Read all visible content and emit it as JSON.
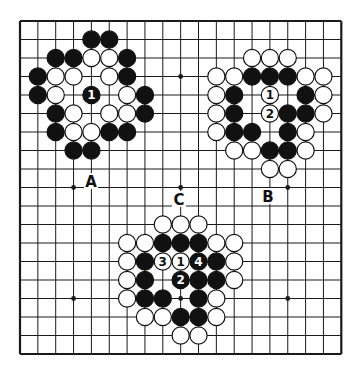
{
  "diagram": {
    "type": "go-board",
    "size": 19,
    "colors": {
      "background": "#ffffff",
      "line": "#1a1a1a",
      "black_stone": "#111111",
      "white_stone": "#ffffff"
    },
    "hoshi": [
      [
        9,
        3
      ],
      [
        3,
        9
      ],
      [
        9,
        9
      ],
      [
        15,
        9
      ],
      [
        3,
        15
      ],
      [
        9,
        15
      ],
      [
        15,
        15
      ]
    ],
    "labels": [
      {
        "text": "A",
        "x": 91,
        "y": 181
      },
      {
        "text": "B",
        "x": 268,
        "y": 196
      },
      {
        "text": "C",
        "x": 179,
        "y": 199
      }
    ],
    "groups": [
      {
        "name": "A",
        "stones": [
          {
            "i": 4,
            "j": 1,
            "c": "B"
          },
          {
            "i": 5,
            "j": 1,
            "c": "B"
          },
          {
            "i": 2,
            "j": 2,
            "c": "B"
          },
          {
            "i": 3,
            "j": 2,
            "c": "B"
          },
          {
            "i": 4,
            "j": 2,
            "c": "W"
          },
          {
            "i": 5,
            "j": 2,
            "c": "W"
          },
          {
            "i": 6,
            "j": 2,
            "c": "B"
          },
          {
            "i": 1,
            "j": 3,
            "c": "B"
          },
          {
            "i": 2,
            "j": 3,
            "c": "W"
          },
          {
            "i": 3,
            "j": 3,
            "c": "W"
          },
          {
            "i": 5,
            "j": 3,
            "c": "W"
          },
          {
            "i": 6,
            "j": 3,
            "c": "B"
          },
          {
            "i": 1,
            "j": 4,
            "c": "B"
          },
          {
            "i": 2,
            "j": 4,
            "c": "W"
          },
          {
            "i": 4,
            "j": 4,
            "c": "B",
            "n": "1"
          },
          {
            "i": 6,
            "j": 4,
            "c": "W"
          },
          {
            "i": 7,
            "j": 4,
            "c": "B"
          },
          {
            "i": 2,
            "j": 5,
            "c": "B"
          },
          {
            "i": 3,
            "j": 5,
            "c": "W"
          },
          {
            "i": 5,
            "j": 5,
            "c": "W"
          },
          {
            "i": 6,
            "j": 5,
            "c": "W"
          },
          {
            "i": 7,
            "j": 5,
            "c": "B"
          },
          {
            "i": 2,
            "j": 6,
            "c": "B"
          },
          {
            "i": 3,
            "j": 6,
            "c": "W"
          },
          {
            "i": 4,
            "j": 6,
            "c": "W"
          },
          {
            "i": 5,
            "j": 6,
            "c": "B"
          },
          {
            "i": 6,
            "j": 6,
            "c": "B"
          },
          {
            "i": 3,
            "j": 7,
            "c": "B"
          },
          {
            "i": 4,
            "j": 7,
            "c": "B"
          }
        ]
      },
      {
        "name": "B",
        "stones": [
          {
            "i": 13,
            "j": 2,
            "c": "W"
          },
          {
            "i": 14,
            "j": 2,
            "c": "W"
          },
          {
            "i": 15,
            "j": 2,
            "c": "W"
          },
          {
            "i": 11,
            "j": 3,
            "c": "W"
          },
          {
            "i": 12,
            "j": 3,
            "c": "W"
          },
          {
            "i": 13,
            "j": 3,
            "c": "B"
          },
          {
            "i": 14,
            "j": 3,
            "c": "B"
          },
          {
            "i": 15,
            "j": 3,
            "c": "B"
          },
          {
            "i": 16,
            "j": 3,
            "c": "W"
          },
          {
            "i": 17,
            "j": 3,
            "c": "W"
          },
          {
            "i": 11,
            "j": 4,
            "c": "W"
          },
          {
            "i": 12,
            "j": 4,
            "c": "B"
          },
          {
            "i": 14,
            "j": 4,
            "c": "W",
            "n": "1"
          },
          {
            "i": 16,
            "j": 4,
            "c": "B"
          },
          {
            "i": 17,
            "j": 4,
            "c": "W"
          },
          {
            "i": 11,
            "j": 5,
            "c": "W"
          },
          {
            "i": 12,
            "j": 5,
            "c": "B"
          },
          {
            "i": 14,
            "j": 5,
            "c": "W",
            "n": "2"
          },
          {
            "i": 15,
            "j": 5,
            "c": "B"
          },
          {
            "i": 16,
            "j": 5,
            "c": "B"
          },
          {
            "i": 17,
            "j": 5,
            "c": "W"
          },
          {
            "i": 11,
            "j": 6,
            "c": "W"
          },
          {
            "i": 12,
            "j": 6,
            "c": "B"
          },
          {
            "i": 13,
            "j": 6,
            "c": "B"
          },
          {
            "i": 15,
            "j": 6,
            "c": "B"
          },
          {
            "i": 16,
            "j": 6,
            "c": "W"
          },
          {
            "i": 12,
            "j": 7,
            "c": "W"
          },
          {
            "i": 13,
            "j": 7,
            "c": "W"
          },
          {
            "i": 14,
            "j": 7,
            "c": "B"
          },
          {
            "i": 15,
            "j": 7,
            "c": "B"
          },
          {
            "i": 16,
            "j": 7,
            "c": "W"
          },
          {
            "i": 14,
            "j": 8,
            "c": "W"
          },
          {
            "i": 15,
            "j": 8,
            "c": "W"
          }
        ]
      },
      {
        "name": "C",
        "stones": [
          {
            "i": 8,
            "j": 11,
            "c": "W"
          },
          {
            "i": 9,
            "j": 11,
            "c": "W"
          },
          {
            "i": 10,
            "j": 11,
            "c": "W"
          },
          {
            "i": 6,
            "j": 12,
            "c": "W"
          },
          {
            "i": 7,
            "j": 12,
            "c": "W"
          },
          {
            "i": 8,
            "j": 12,
            "c": "B"
          },
          {
            "i": 9,
            "j": 12,
            "c": "B"
          },
          {
            "i": 10,
            "j": 12,
            "c": "B"
          },
          {
            "i": 11,
            "j": 12,
            "c": "W"
          },
          {
            "i": 12,
            "j": 12,
            "c": "W"
          },
          {
            "i": 6,
            "j": 13,
            "c": "W"
          },
          {
            "i": 7,
            "j": 13,
            "c": "B"
          },
          {
            "i": 8,
            "j": 13,
            "c": "W",
            "n": "3"
          },
          {
            "i": 9,
            "j": 13,
            "c": "W",
            "n": "1"
          },
          {
            "i": 10,
            "j": 13,
            "c": "B",
            "n": "4"
          },
          {
            "i": 11,
            "j": 13,
            "c": "B"
          },
          {
            "i": 12,
            "j": 13,
            "c": "W"
          },
          {
            "i": 6,
            "j": 14,
            "c": "W"
          },
          {
            "i": 7,
            "j": 14,
            "c": "B"
          },
          {
            "i": 9,
            "j": 14,
            "c": "B",
            "n": "2"
          },
          {
            "i": 10,
            "j": 14,
            "c": "B"
          },
          {
            "i": 11,
            "j": 14,
            "c": "B"
          },
          {
            "i": 12,
            "j": 14,
            "c": "W"
          },
          {
            "i": 6,
            "j": 15,
            "c": "W"
          },
          {
            "i": 7,
            "j": 15,
            "c": "B"
          },
          {
            "i": 8,
            "j": 15,
            "c": "B"
          },
          {
            "i": 10,
            "j": 15,
            "c": "B"
          },
          {
            "i": 11,
            "j": 15,
            "c": "W"
          },
          {
            "i": 7,
            "j": 16,
            "c": "W"
          },
          {
            "i": 8,
            "j": 16,
            "c": "W"
          },
          {
            "i": 9,
            "j": 16,
            "c": "B"
          },
          {
            "i": 10,
            "j": 16,
            "c": "B"
          },
          {
            "i": 11,
            "j": 16,
            "c": "W"
          },
          {
            "i": 9,
            "j": 17,
            "c": "W"
          },
          {
            "i": 10,
            "j": 17,
            "c": "W"
          }
        ]
      }
    ]
  }
}
